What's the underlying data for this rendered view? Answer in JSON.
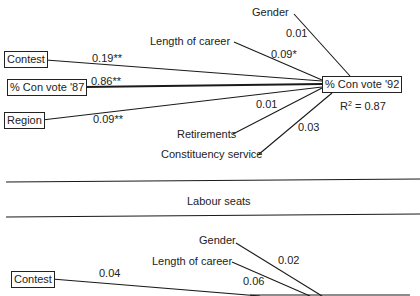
{
  "conservative_panel": {
    "dependent": {
      "label": "% Con vote '92",
      "r2_label": "R",
      "r2_sup": "2",
      "r2_value": " = 0.87"
    },
    "boxed_predictors": [
      {
        "label": "Contest",
        "coef": "0.19**"
      },
      {
        "label": "% Con vote '87",
        "coef": "0.86**"
      },
      {
        "label": "Region",
        "coef": "0.09**"
      }
    ],
    "unboxed_predictors": [
      {
        "label": "Gender",
        "coef": "0.01"
      },
      {
        "label": "Length of career",
        "coef": "0.09*"
      },
      {
        "label": "Retirements",
        "coef": "0.01"
      },
      {
        "label": "Constituency service",
        "coef": "0.03"
      }
    ]
  },
  "section_divider": {
    "label": "Labour seats"
  },
  "labour_panel": {
    "boxed_predictors": [
      {
        "label": "Contest",
        "coef": "0.04"
      }
    ],
    "unboxed_predictors": [
      {
        "label": "Gender",
        "coef": "0.02"
      },
      {
        "label": "Length of career",
        "coef": "0.06"
      }
    ]
  }
}
